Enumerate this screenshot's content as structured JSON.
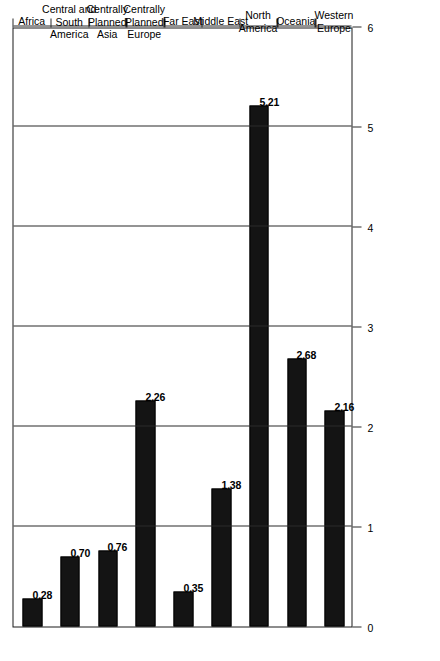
{
  "chart_data": {
    "type": "bar",
    "orientation": "horizontal",
    "title": "",
    "subtitle": "",
    "xlabel": "",
    "ylabel": "",
    "categories": [
      "Africa",
      "Central and South America",
      "Centrally Planned Asia",
      "Centrally Planned Europe",
      "Far East",
      "Middle East",
      "North America",
      "Oceania",
      "Western Europe"
    ],
    "category_lines": [
      [
        "Africa"
      ],
      [
        "Central and",
        "South",
        "America"
      ],
      [
        "Centrally",
        "Planned",
        "Asia"
      ],
      [
        "Centrally",
        "Planned",
        "Europe"
      ],
      [
        "Far East"
      ],
      [
        "Middle East"
      ],
      [
        "North",
        "America"
      ],
      [
        "Oceania"
      ],
      [
        "Western",
        "Europe"
      ]
    ],
    "values": [
      0.28,
      0.7,
      0.76,
      2.26,
      0.35,
      1.38,
      5.21,
      2.68,
      2.16
    ],
    "value_labels": [
      "0.28",
      "0.70",
      "0.76",
      "2.26",
      "0.35",
      "1.38",
      "5.21",
      "2.68",
      "2.16"
    ],
    "axis_ticks": [
      0,
      1,
      2,
      3,
      4,
      5,
      6
    ],
    "axis_tick_labels": [
      "0",
      "1",
      "2",
      "3",
      "4",
      "5",
      "6"
    ],
    "xlim": [
      0,
      6
    ],
    "grid": true,
    "grid_axis": "value",
    "legend": false,
    "legend_position": "none",
    "bar_color": "#141414",
    "background_color": "#ffffff",
    "axis_color": "#1a1a1a",
    "page_rotation_degrees": -90
  }
}
